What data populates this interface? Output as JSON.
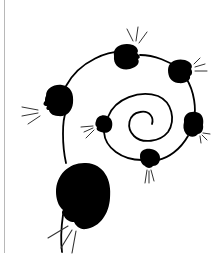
{
  "illustration": {
    "title": "Spiral of speaking heads",
    "colors": {
      "background": "#ffffff",
      "ink": "#000000",
      "frame_rule": "#b8b8b8",
      "speech_lines": "#222222"
    },
    "heads": [
      {
        "id": "head-top",
        "cx": 127,
        "cy": 57,
        "rx": 15,
        "ry": 12,
        "speech_direction": "up"
      },
      {
        "id": "head-upper-right",
        "cx": 180,
        "cy": 71,
        "rx": 12,
        "ry": 12,
        "speech_direction": "right"
      },
      {
        "id": "head-right",
        "cx": 193,
        "cy": 125,
        "rx": 10,
        "ry": 12,
        "speech_direction": "down-right"
      },
      {
        "id": "head-bottom-small",
        "cx": 150,
        "cy": 159,
        "rx": 10,
        "ry": 9,
        "speech_direction": "down"
      },
      {
        "id": "head-inner-left",
        "cx": 104,
        "cy": 124,
        "rx": 9,
        "ry": 9,
        "speech_direction": "left"
      },
      {
        "id": "head-left",
        "cx": 58,
        "cy": 100,
        "rx": 16,
        "ry": 16,
        "speech_direction": "left"
      },
      {
        "id": "head-large-bottom",
        "cx": 82,
        "cy": 196,
        "rx": 29,
        "ry": 34,
        "speech_direction": "down-left"
      }
    ]
  }
}
